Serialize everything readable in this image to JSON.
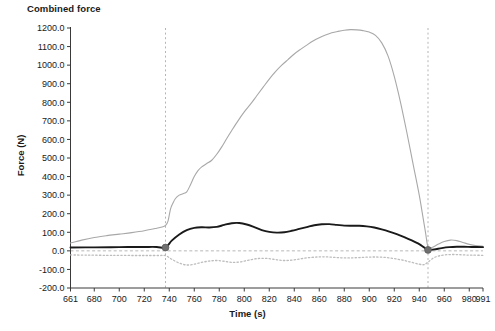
{
  "chart_data": {
    "type": "line",
    "title": "Combined force",
    "xlabel": "Time (s)",
    "ylabel": "Force (N)",
    "xlim": [
      661,
      991
    ],
    "ylim": [
      -200,
      1200
    ],
    "grid": false,
    "legend": "none",
    "x_ticks": [
      661,
      680,
      700,
      720,
      740,
      760,
      780,
      800,
      820,
      840,
      860,
      880,
      900,
      920,
      940,
      960,
      980,
      991
    ],
    "x_tick_labels": [
      "661",
      "680",
      "700",
      "720",
      "740",
      "760",
      "780",
      "800",
      "820",
      "840",
      "860",
      "880",
      "900",
      "920",
      "940",
      "960",
      "980",
      "991"
    ],
    "y_ticks": [
      -200,
      -100,
      0,
      100,
      200,
      300,
      400,
      500,
      600,
      700,
      800,
      900,
      1000,
      1100,
      1200
    ],
    "y_tick_labels": [
      "-200.0",
      "-100.0",
      "0.0",
      "100.0",
      "200.0",
      "300.0",
      "400.0",
      "500.0",
      "600.0",
      "700.0",
      "800.0",
      "900.0",
      "1000.0",
      "1100.0",
      "1200.0"
    ],
    "annotations": {
      "zero_reference_line": {
        "y": 0,
        "style": "dashed",
        "color": "#b0b0b0"
      },
      "vertical_markers": [
        {
          "x": 737,
          "style": "dashed",
          "color": "#b5b5b5"
        },
        {
          "x": 947,
          "style": "dashed",
          "color": "#b5b5b5"
        }
      ],
      "point_markers": [
        {
          "x": 737,
          "y": 18,
          "color": "#707070"
        },
        {
          "x": 947,
          "y": 5,
          "color": "#707070"
        }
      ]
    },
    "series": [
      {
        "name": "light-gray-solid",
        "color": "#a8a8a8",
        "style": "solid",
        "x": [
          661,
          670,
          680,
          690,
          700,
          710,
          720,
          730,
          735,
          737,
          739,
          741,
          743,
          745,
          748,
          751,
          754,
          757,
          760,
          763,
          766,
          770,
          774,
          778,
          782,
          786,
          790,
          795,
          800,
          805,
          810,
          815,
          820,
          825,
          830,
          835,
          840,
          845,
          850,
          855,
          860,
          865,
          870,
          875,
          880,
          885,
          890,
          895,
          900,
          905,
          910,
          915,
          920,
          925,
          930,
          935,
          940,
          943,
          945,
          947,
          950,
          955,
          960,
          965,
          970,
          975,
          980,
          985,
          991
        ],
        "values": [
          42,
          58,
          72,
          82,
          90,
          98,
          108,
          122,
          130,
          137,
          160,
          225,
          258,
          282,
          300,
          308,
          318,
          356,
          400,
          432,
          452,
          470,
          488,
          520,
          560,
          605,
          648,
          700,
          748,
          790,
          835,
          880,
          925,
          965,
          1000,
          1030,
          1060,
          1085,
          1108,
          1130,
          1148,
          1162,
          1174,
          1182,
          1188,
          1191,
          1190,
          1186,
          1178,
          1160,
          1120,
          1050,
          940,
          800,
          640,
          470,
          300,
          180,
          100,
          20,
          18,
          35,
          50,
          58,
          55,
          45,
          35,
          28,
          25
        ]
      },
      {
        "name": "black-solid",
        "color": "#1a1a1a",
        "style": "solid",
        "x": [
          661,
          680,
          700,
          720,
          730,
          737,
          742,
          748,
          754,
          760,
          766,
          772,
          778,
          784,
          790,
          796,
          802,
          808,
          814,
          820,
          826,
          832,
          838,
          844,
          850,
          856,
          862,
          868,
          874,
          880,
          886,
          892,
          898,
          904,
          910,
          916,
          922,
          928,
          934,
          940,
          944,
          947,
          952,
          958,
          964,
          970,
          976,
          982,
          991
        ],
        "values": [
          18,
          19,
          20,
          21,
          21,
          18,
          55,
          88,
          112,
          124,
          127,
          126,
          129,
          140,
          149,
          150,
          142,
          128,
          112,
          102,
          98,
          100,
          108,
          118,
          128,
          138,
          143,
          144,
          140,
          136,
          135,
          135,
          132,
          126,
          116,
          104,
          90,
          74,
          56,
          36,
          18,
          5,
          8,
          15,
          20,
          22,
          22,
          21,
          20
        ]
      },
      {
        "name": "light-gray-dotted",
        "color": "#bdbdbd",
        "style": "dotted",
        "x": [
          661,
          675,
          690,
          700,
          712,
          722,
          732,
          737,
          742,
          748,
          754,
          760,
          766,
          772,
          778,
          784,
          790,
          796,
          802,
          808,
          814,
          820,
          826,
          832,
          838,
          844,
          850,
          856,
          862,
          868,
          874,
          880,
          886,
          892,
          898,
          904,
          910,
          916,
          922,
          928,
          934,
          940,
          944,
          947,
          952,
          958,
          964,
          970,
          976,
          982,
          991
        ],
        "values": [
          -22,
          -23,
          -24,
          -24,
          -25,
          -25,
          -25,
          -26,
          -45,
          -66,
          -76,
          -72,
          -62,
          -55,
          -52,
          -56,
          -62,
          -60,
          -52,
          -44,
          -40,
          -42,
          -48,
          -52,
          -50,
          -44,
          -38,
          -34,
          -32,
          -33,
          -36,
          -38,
          -38,
          -36,
          -34,
          -33,
          -34,
          -38,
          -44,
          -52,
          -62,
          -72,
          -74,
          -60,
          -36,
          -24,
          -20,
          -20,
          -22,
          -23,
          -24
        ]
      }
    ]
  }
}
